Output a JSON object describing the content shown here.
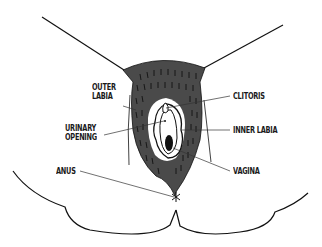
{
  "diagram": {
    "type": "labeled-anatomical-illustration",
    "colors": {
      "outline": "#111111",
      "shading": "#4a4a4a",
      "hair_marks": "#111111",
      "background": "#ffffff"
    },
    "labels": [
      {
        "id": "outer-labia",
        "line1": "OUTER",
        "line2": "LABIA",
        "side": "left"
      },
      {
        "id": "urinary-opening",
        "line1": "URINARY",
        "line2": "OPENING",
        "side": "left"
      },
      {
        "id": "anus",
        "line1": "ANUS",
        "side": "left"
      },
      {
        "id": "clitoris",
        "line1": "CLITORIS",
        "side": "right"
      },
      {
        "id": "inner-labia",
        "line1": "INNER LABIA",
        "side": "right"
      },
      {
        "id": "vagina",
        "line1": "VAGINA",
        "side": "right"
      }
    ]
  }
}
